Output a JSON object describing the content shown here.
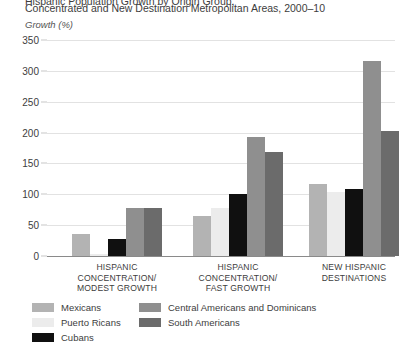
{
  "title": {
    "cut_line": "Hispanic Population Growth by Origin Group,",
    "line": "Concentrated and New Destination Metropolitan Areas, 2000–10"
  },
  "axis_unit_label": "Growth (%)",
  "chart_data": {
    "type": "bar",
    "title": "Concentrated and New Destination Metropolitan Areas, 2000–10",
    "xlabel": "",
    "ylabel": "Growth (%)",
    "ylim": [
      0,
      350
    ],
    "yticks": [
      0,
      50,
      100,
      150,
      200,
      250,
      300,
      350
    ],
    "grid": true,
    "legend_position": "bottom-left",
    "categories": [
      "HISPANIC CONCENTRATION/ MODEST GROWTH",
      "HISPANIC CONCENTRATION/ FAST GROWTH",
      "NEW HISPANIC DESTINATIONS"
    ],
    "category_lines": [
      [
        "HISPANIC",
        "CONCENTRATION/",
        "MODEST GROWTH"
      ],
      [
        "HISPANIC",
        "CONCENTRATION/",
        "FAST GROWTH"
      ],
      [
        "NEW HISPANIC",
        "DESTINATIONS"
      ]
    ],
    "series": [
      {
        "name": "Mexicans",
        "color": "#b3b3b3",
        "values": [
          36,
          65,
          117
        ]
      },
      {
        "name": "Puerto Ricans",
        "color": "#ececec",
        "values": [
          3,
          78,
          104
        ]
      },
      {
        "name": "Cubans",
        "color": "#101010",
        "values": [
          28,
          100,
          108
        ]
      },
      {
        "name": "Central Americans and Dominicans",
        "color": "#8f8f8f",
        "values": [
          78,
          193,
          316
        ]
      },
      {
        "name": "South Americans",
        "color": "#6b6b6b",
        "values": [
          78,
          168,
          202
        ]
      }
    ]
  }
}
